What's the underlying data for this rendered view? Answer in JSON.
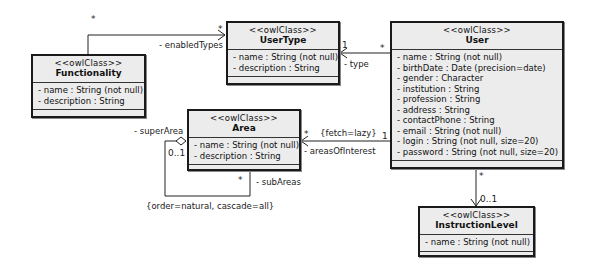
{
  "diagram": {
    "type": "UML class diagram",
    "classes": {
      "functionality": {
        "stereotype": "<<owlClass>>",
        "name": "Functionality",
        "attributes": [
          "- name : String (not null)",
          "- description : String"
        ]
      },
      "usertype": {
        "stereotype": "<<owlClass>>",
        "name": "UserType",
        "attributes": [
          "- name : String (not null)",
          "- description : String"
        ]
      },
      "user": {
        "stereotype": "<<owlClass>>",
        "name": "User",
        "attributes": [
          "- name : String (not null)",
          "- birthDate : Date (precision=date)",
          "- gender : Character",
          "- institution : String",
          "- profession : String",
          "- address : String",
          "- contactPhone : String",
          "- email : String (not null)",
          "- login : String (not null, size=20)",
          "- password : String (not null, size=20)"
        ]
      },
      "area": {
        "stereotype": "<<owlClass>>",
        "name": "Area",
        "attributes": [
          "- name : String (not null)",
          "- description : String"
        ]
      },
      "instructionlevel": {
        "stereotype": "<<owlClass>>",
        "name": "InstructionLevel",
        "attributes": [
          "- name : String (not null)"
        ]
      }
    },
    "associations": {
      "enabled_types": {
        "role": "- enabledTypes",
        "source_mult": "*",
        "target_mult": "*"
      },
      "type": {
        "role": "- type",
        "source_mult": "*",
        "target_mult": "1"
      },
      "areas_of_interest": {
        "role": "- areasOfInterest",
        "constraint": "{fetch=lazy}",
        "source_mult": "1",
        "target_mult": "*"
      },
      "super_area": {
        "role": "- superArea",
        "mult": "0..1"
      },
      "sub_areas": {
        "role": "- subAreas",
        "mult": "*",
        "constraint": "{order=natural, cascade=all}"
      },
      "instruction_level": {
        "source_mult": "*",
        "target_mult": "0..1"
      }
    }
  }
}
